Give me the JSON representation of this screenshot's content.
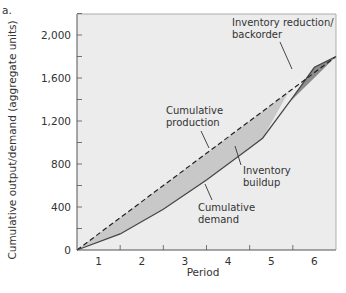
{
  "figure_label": "a.",
  "chart_data": {
    "type": "area",
    "title": "",
    "xlabel": "Period",
    "ylabel": "Cumulative output/demand (aggregate units)",
    "x_ticks": [
      "1",
      "2",
      "3",
      "4",
      "5",
      "6"
    ],
    "y_ticks": [
      "0",
      "400",
      "800",
      "1,200",
      "1,600",
      "2,000"
    ],
    "y_tick_values": [
      0,
      400,
      800,
      1200,
      1600,
      2000
    ],
    "xlim": [
      0,
      6
    ],
    "ylim": [
      0,
      2200
    ],
    "grid": false,
    "series": [
      {
        "name": "Cumulative production",
        "style": "dashed",
        "x": [
          0,
          6
        ],
        "values": [
          0,
          1800
        ]
      },
      {
        "name": "Cumulative demand",
        "style": "solid",
        "x": [
          0,
          1,
          2,
          3,
          4,
          4.3,
          5,
          5.5,
          6
        ],
        "values": [
          0,
          150,
          380,
          650,
          950,
          1040,
          1420,
          1700,
          1800
        ]
      }
    ],
    "regions": [
      {
        "name": "Inventory buildup",
        "between": [
          "Cumulative production",
          "Cumulative demand"
        ],
        "x_range": [
          0,
          4.9
        ],
        "color": "#c8c8c8"
      },
      {
        "name": "Inventory reduction/backorder",
        "between": [
          "Cumulative demand",
          "Cumulative production"
        ],
        "x_range": [
          4.9,
          6
        ],
        "color": "#8c8c8c"
      }
    ],
    "annotations": [
      {
        "lines": [
          "Inventory reduction/",
          "backorder"
        ]
      },
      {
        "lines": [
          "Cumulative",
          "production"
        ]
      },
      {
        "lines": [
          "Inventory",
          "buildup"
        ]
      },
      {
        "lines": [
          "Cumulative",
          "demand"
        ]
      }
    ],
    "colors": {
      "plot_bg": "#ececec",
      "axis": "#555555",
      "buildup_fill": "#c8c8c8",
      "backorder_fill": "#8c8c8c",
      "line": "#444444"
    }
  }
}
